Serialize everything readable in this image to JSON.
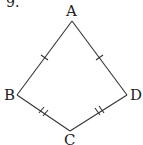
{
  "problem_number": "9.",
  "figure": {
    "type": "kite",
    "vertices": {
      "A": {
        "label": "A",
        "x": 72,
        "y": 21
      },
      "B": {
        "label": "B",
        "x": 17,
        "y": 95
      },
      "C": {
        "label": "C",
        "x": 70,
        "y": 131
      },
      "D": {
        "label": "D",
        "x": 127,
        "y": 95
      }
    },
    "edges": [
      {
        "from": "A",
        "to": "B",
        "tick_marks": 1
      },
      {
        "from": "A",
        "to": "D",
        "tick_marks": 1
      },
      {
        "from": "B",
        "to": "C",
        "tick_marks": 2
      },
      {
        "from": "C",
        "to": "D",
        "tick_marks": 2
      }
    ],
    "stroke_color": "#333333"
  }
}
